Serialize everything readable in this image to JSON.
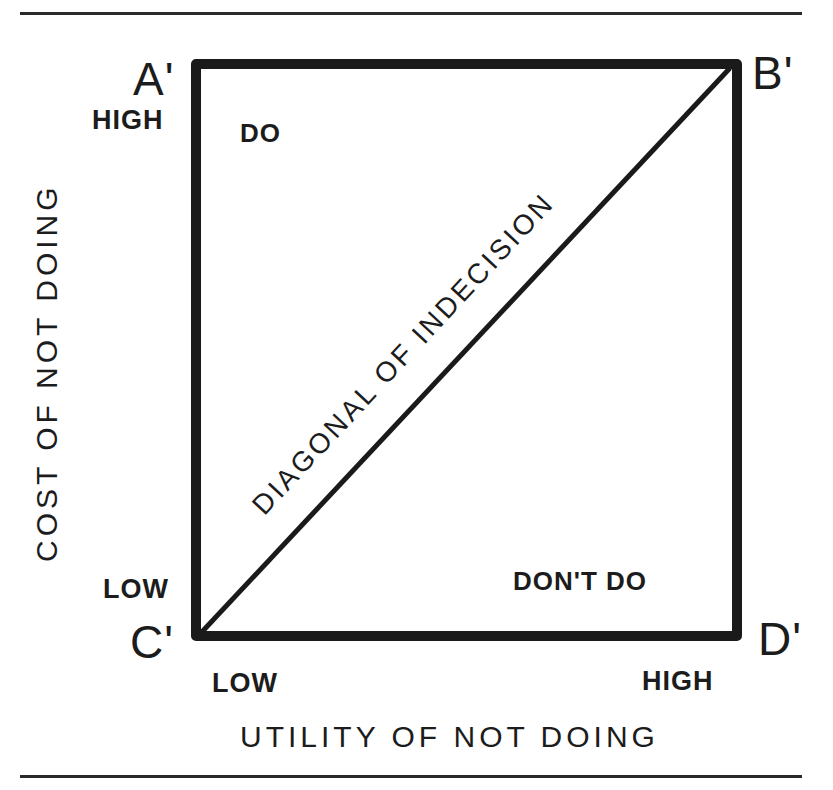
{
  "diagram": {
    "type": "decision-matrix",
    "corners": {
      "top_left": "A'",
      "top_right": "B'",
      "bottom_left": "C'",
      "bottom_right": "D'"
    },
    "y_axis": {
      "label": "COST OF NOT DOING",
      "high": "HIGH",
      "low": "LOW"
    },
    "x_axis": {
      "label": "UTILITY OF NOT DOING",
      "low": "LOW",
      "high": "HIGH"
    },
    "regions": {
      "upper_left": "DO",
      "lower_right": "DON'T DO"
    },
    "diagonal_label": "DIAGONAL OF INDECISION",
    "colors": {
      "ink": "#1a1a1a",
      "background": "#ffffff"
    }
  }
}
